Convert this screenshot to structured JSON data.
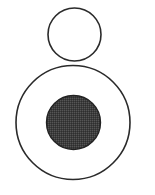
{
  "diagram": {
    "background": "#ffffff",
    "stroke_color": "#2a2a2a",
    "fill_color": "#3d3d3d",
    "shapes": [
      {
        "id": "top-circle",
        "type": "circle",
        "cx": 74.5,
        "cy": 34.5,
        "r": 26.5,
        "fill": "none",
        "stroke_width": 1.6
      },
      {
        "id": "outer-circle",
        "type": "circle",
        "cx": 73,
        "cy": 122.5,
        "r": 57,
        "fill": "none",
        "stroke_width": 1.6
      },
      {
        "id": "inner-filled-circle",
        "type": "circle",
        "cx": 73.5,
        "cy": 122.5,
        "r": 27,
        "fill": "dark",
        "stroke_width": 1.4
      }
    ]
  }
}
